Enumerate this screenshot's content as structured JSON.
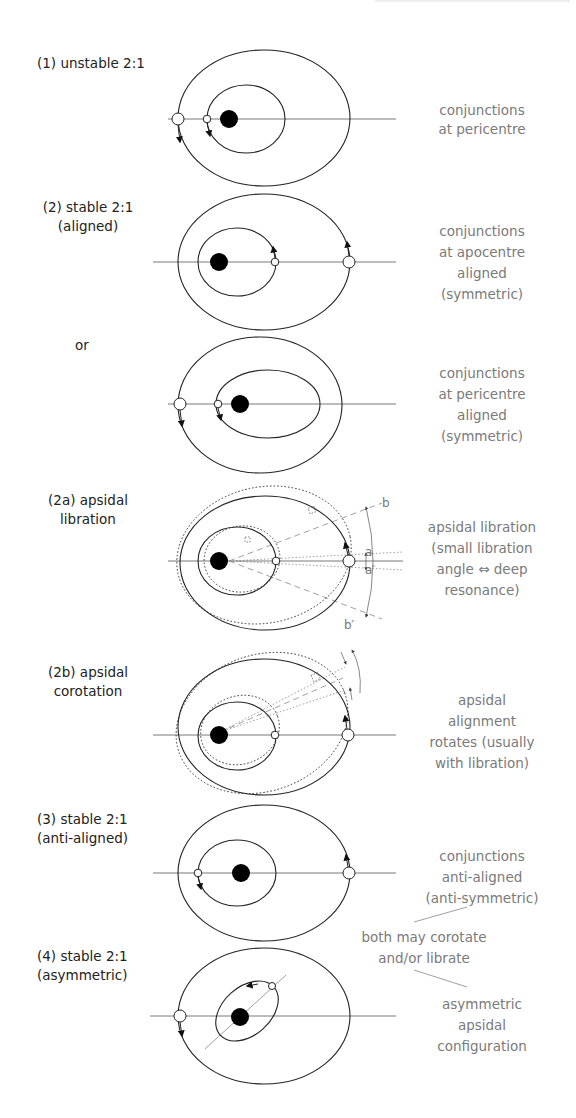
{
  "colors": {
    "orbit": "#222222",
    "label_text": "#222222",
    "description_text": "#7a7a7a",
    "guide_lines": "#888888",
    "central_body": "#000000",
    "planet_fill": "#ffffff"
  },
  "panels": [
    {
      "id": "1",
      "label_lines": [
        "(1) unstable 2:1"
      ],
      "description_lines": [
        "conjunctions",
        "at pericentre"
      ]
    },
    {
      "id": "2",
      "label_lines": [
        "(2) stable 2:1",
        "(aligned)"
      ],
      "description_lines": [
        "conjunctions",
        "at apocentre",
        "aligned",
        "(symmetric)"
      ]
    },
    {
      "id": "2-or",
      "label_lines": [
        "or"
      ],
      "description_lines": [
        "conjunctions",
        "at pericentre",
        "aligned",
        "(symmetric)"
      ]
    },
    {
      "id": "2a",
      "label_lines": [
        "(2a) apsidal",
        "libration"
      ],
      "description_lines": [
        "apsidal libration",
        "(small libration",
        "angle ⇔ deep",
        "resonance)"
      ],
      "angle_labels": {
        "b": "b",
        "a": "a",
        "a_prime": "a′",
        "b_prime": "b′"
      }
    },
    {
      "id": "2b",
      "label_lines": [
        "(2b) apsidal",
        "corotation"
      ],
      "description_lines": [
        "apsidal",
        "alignment",
        "rotates (usually",
        "with libration)"
      ]
    },
    {
      "id": "3",
      "label_lines": [
        "(3) stable 2:1",
        "(anti-aligned)"
      ],
      "description_lines": [
        "conjunctions",
        "anti-aligned",
        "(anti-symmetric)"
      ]
    },
    {
      "id": "4",
      "label_lines": [
        "(4) stable 2:1",
        "(asymmetric)"
      ],
      "description_lines": [
        "asymmetric",
        "apsidal",
        "configuration"
      ]
    }
  ],
  "shared_note": {
    "lines": [
      "both may corotate",
      "and/or librate"
    ],
    "applies_to": [
      "3",
      "4"
    ]
  }
}
